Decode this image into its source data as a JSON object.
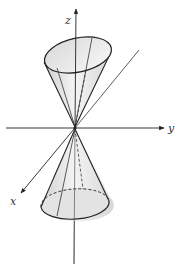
{
  "diagram": {
    "title": "",
    "axes": {
      "x_label": "x",
      "y_label": "y",
      "z_label": "z"
    },
    "colors": {
      "line": "#222222",
      "fill_light": "#f2f2f2",
      "fill_dark": "#c8c8c8",
      "background": "#ffffff"
    }
  }
}
